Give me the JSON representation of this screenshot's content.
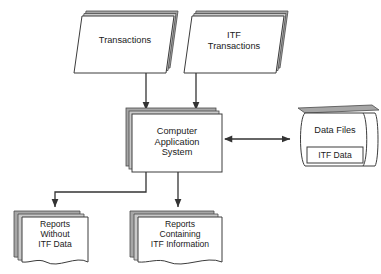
{
  "diagram": {
    "colors": {
      "stroke": "#3c3c3c",
      "fill": "#ffffff",
      "shadow": "#a6a6a6",
      "shadow_light": "#c9c9c9",
      "text": "#1a1a1a",
      "arrow": "#333333",
      "background": "#ffffff"
    },
    "nodes": {
      "transactions": {
        "label": "Transactions",
        "shape": "document-stack-skewed"
      },
      "itf_transactions": {
        "label": "ITF\nTransactions",
        "shape": "document-stack-skewed"
      },
      "application": {
        "label": "Computer\nApplication\nSystem",
        "shape": "process-box-stack"
      },
      "data_files": {
        "label": "Data Files",
        "shape": "cylinder-horizontal"
      },
      "itf_data": {
        "label": "ITF Data",
        "shape": "inner-box"
      },
      "reports_without": {
        "label": "Reports\nWithout\nITF Data",
        "shape": "report-stack"
      },
      "reports_containing": {
        "label": "Reports\nContaining\nITF Information",
        "shape": "report-stack"
      }
    },
    "edges": [
      {
        "from": "transactions",
        "to": "application",
        "type": "arrow",
        "direction": "down"
      },
      {
        "from": "itf_transactions",
        "to": "application",
        "type": "arrow",
        "direction": "down"
      },
      {
        "from": "application",
        "to": "data_files",
        "type": "arrow",
        "direction": "both"
      },
      {
        "from": "application",
        "to": "reports_without",
        "type": "arrow",
        "direction": "down-left-elbow"
      },
      {
        "from": "application",
        "to": "reports_containing",
        "type": "arrow",
        "direction": "down"
      }
    ]
  }
}
